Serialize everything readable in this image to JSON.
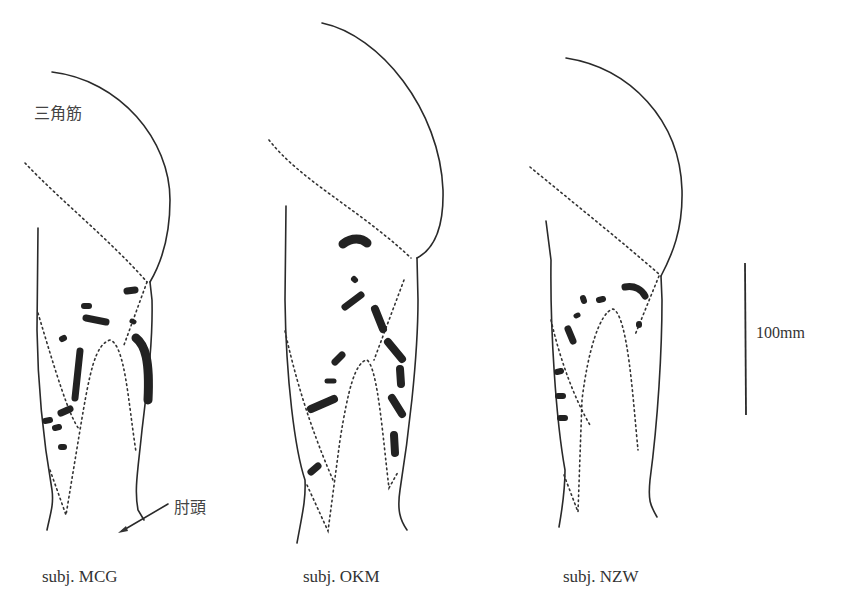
{
  "figure": {
    "type": "anatomical-diagram",
    "labels": {
      "deltoid": "三角筋",
      "elbow": "肘頭",
      "scale_bar": "100mm"
    },
    "subjects": [
      {
        "id": "MCG",
        "label": "subj. MCG"
      },
      {
        "id": "OKM",
        "label": "subj. OKM"
      },
      {
        "id": "NZW",
        "label": "subj. NZW"
      }
    ],
    "colors": {
      "outline": "#2a2a2a",
      "marks": "#222222",
      "background": "#ffffff"
    }
  }
}
